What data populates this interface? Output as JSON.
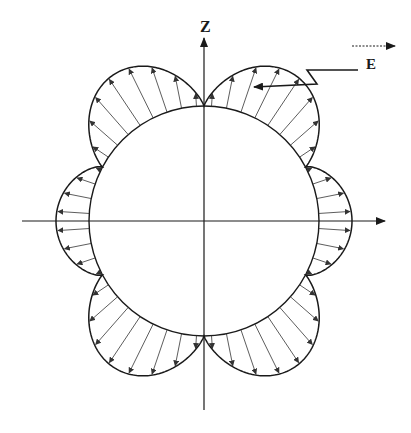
{
  "figure": {
    "type": "field-distribution-diagram",
    "labels": {
      "z_axis": "Z",
      "field": "E"
    },
    "geometry": {
      "center": [
        204,
        221
      ],
      "sphere_radius": 115,
      "z_axis": {
        "top": 38,
        "bottom": 410
      },
      "x_axis": {
        "left": 22,
        "right": 385
      },
      "lobes": [
        {
          "name": "upper-right",
          "peak_angle_from_z_deg": 30,
          "peak_radius": 172
        },
        {
          "name": "upper-left",
          "peak_angle_from_z_deg": -30,
          "peak_radius": 172
        },
        {
          "name": "lower-right",
          "peak_angle_from_z_deg": 150,
          "peak_radius": 172
        },
        {
          "name": "lower-left",
          "peak_angle_from_z_deg": -150,
          "peak_radius": 172
        },
        {
          "name": "right-side",
          "peak_angle_from_z_deg": 90,
          "peak_radius": 148
        },
        {
          "name": "left-side",
          "peak_angle_from_z_deg": -90,
          "peak_radius": 148
        }
      ],
      "arrows_direction": "radially outward from sphere surface to pattern outline"
    },
    "annotations": {
      "field_direction_arrow": {
        "x1": 352,
        "y1": 46,
        "x2": 395,
        "y2": 46,
        "style": "dashed"
      },
      "leader_line": {
        "points": [
          [
            358,
            70
          ],
          [
            307,
            70
          ],
          [
            317,
            84
          ],
          [
            254,
            87
          ]
        ]
      }
    },
    "colors": {
      "line": "#1a1a1a",
      "arrow": "#333333",
      "background": "#ffffff"
    }
  }
}
